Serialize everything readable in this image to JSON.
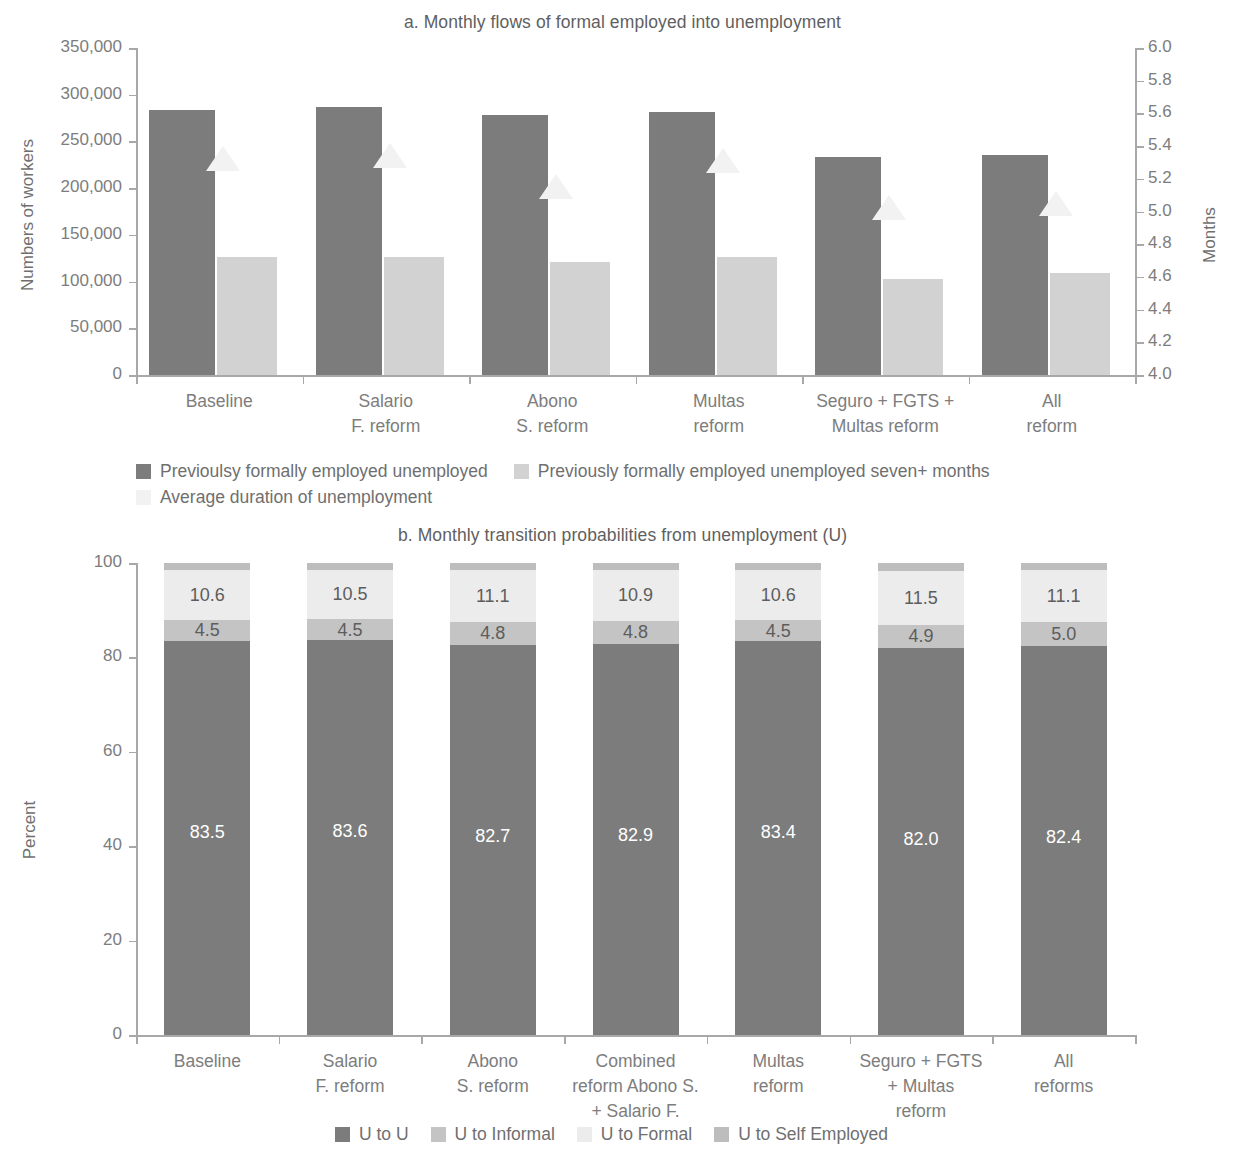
{
  "panel_a": {
    "title": "a. Monthly flows of formal employed into unemployment",
    "y_left_label": "Numbers of workers",
    "y_right_label": "Months",
    "y_left_ticks": [
      "0",
      "50,000",
      "100,000",
      "150,000",
      "200,000",
      "250,000",
      "300,000",
      "350,000"
    ],
    "y_right_ticks": [
      "4.0",
      "4.2",
      "4.4",
      "4.6",
      "4.8",
      "5.0",
      "5.2",
      "5.4",
      "5.6",
      "5.8",
      "6.0"
    ],
    "categories": [
      "Baseline",
      "Salario\nF. reform",
      "Abono\nS. reform",
      "Multas\nreform",
      "Seguro + FGTS +\nMultas reform",
      "All\nreform"
    ],
    "legend": [
      {
        "label": "Previoulsy formally employed unemployed",
        "color": "#7c7c7c"
      },
      {
        "label": "Previously formally employed unemployed seven+ months",
        "color": "#d2d2d2"
      },
      {
        "label": "Average duration of unemployment",
        "color": "#f2f2f2"
      }
    ]
  },
  "panel_b": {
    "title": "b. Monthly transition probabilities from unemployment (U)",
    "y_label": "Percent",
    "y_ticks": [
      "0",
      "20",
      "40",
      "60",
      "80",
      "100"
    ],
    "categories": [
      "Baseline",
      "Salario\nF. reform",
      "Abono\nS. reform",
      "Combined\nreform Abono S.\n+ Salario F.",
      "Multas\nreform",
      "Seguro + FGTS\n+ Multas\nreform",
      "All\nreforms"
    ],
    "legend": [
      {
        "label": "U to U",
        "color": "#7c7c7c"
      },
      {
        "label": "U to Informal",
        "color": "#c4c4c4"
      },
      {
        "label": "U to Formal",
        "color": "#ececec"
      },
      {
        "label": "U to Self Employed",
        "color": "#bdbdbd"
      }
    ]
  },
  "chart_data": [
    {
      "type": "bar",
      "title": "a. Monthly flows of formal employed into unemployment",
      "xlabel": "",
      "ylabel": "Numbers of workers",
      "y2label": "Months",
      "ylim": [
        0,
        350000
      ],
      "y2lim": [
        4.0,
        6.0
      ],
      "yticks": [
        0,
        50000,
        100000,
        150000,
        200000,
        250000,
        300000,
        350000
      ],
      "y2ticks": [
        4.0,
        4.2,
        4.4,
        4.6,
        4.8,
        5.0,
        5.2,
        5.4,
        5.6,
        5.8,
        6.0
      ],
      "grid": false,
      "legend_position": "bottom-left",
      "categories": [
        "Baseline",
        "Salario F. reform",
        "Abono S. reform",
        "Multas reform",
        "Seguro + FGTS + Multas reform",
        "All reform"
      ],
      "series": [
        {
          "name": "Previoulsy formally employed unemployed",
          "axis": "left",
          "type": "bar",
          "color": "#7c7c7c",
          "values": [
            284000,
            287000,
            278000,
            282000,
            233000,
            236000
          ]
        },
        {
          "name": "Previously formally employed unemployed seven+ months",
          "axis": "left",
          "type": "bar",
          "color": "#d2d2d2",
          "values": [
            126000,
            126000,
            121000,
            126000,
            103000,
            109000
          ]
        },
        {
          "name": "Average duration of unemployment",
          "axis": "right",
          "type": "marker",
          "marker": "triangle",
          "color": "#f2f2f2",
          "values": [
            5.38,
            5.4,
            5.21,
            5.37,
            5.08,
            5.11
          ]
        }
      ]
    },
    {
      "type": "bar",
      "stacked": true,
      "title": "b. Monthly transition probabilities from unemployment (U)",
      "xlabel": "",
      "ylabel": "Percent",
      "ylim": [
        0,
        100
      ],
      "yticks": [
        0,
        20,
        40,
        60,
        80,
        100
      ],
      "grid": false,
      "legend_position": "bottom-center",
      "categories": [
        "Baseline",
        "Salario F. reform",
        "Abono S. reform",
        "Combined reform Abono S. + Salario F.",
        "Multas reform",
        "Seguro + FGTS + Multas reform",
        "All reforms"
      ],
      "series": [
        {
          "name": "U to U",
          "color": "#7c7c7c",
          "values": [
            83.5,
            83.6,
            82.7,
            82.9,
            83.4,
            82.0,
            82.4
          ],
          "labels": [
            "83.5",
            "83.6",
            "82.7",
            "82.9",
            "83.4",
            "82.0",
            "82.4"
          ]
        },
        {
          "name": "U to Informal",
          "color": "#c4c4c4",
          "values": [
            4.5,
            4.5,
            4.8,
            4.8,
            4.5,
            4.9,
            5.0
          ],
          "labels": [
            "4.5",
            "4.5",
            "4.8",
            "4.8",
            "4.5",
            "4.9",
            "5.0"
          ]
        },
        {
          "name": "U to Formal",
          "color": "#ececec",
          "values": [
            10.6,
            10.5,
            11.1,
            10.9,
            10.6,
            11.5,
            11.1
          ],
          "labels": [
            "10.6",
            "10.5",
            "11.1",
            "10.9",
            "10.6",
            "11.5",
            "11.1"
          ]
        },
        {
          "name": "U to Self Employed",
          "color": "#bdbdbd",
          "values": [
            1.4,
            1.4,
            1.4,
            1.4,
            1.5,
            1.6,
            1.5
          ],
          "labels": [
            "",
            "",
            "",
            "",
            "",
            "",
            ""
          ]
        }
      ]
    }
  ]
}
